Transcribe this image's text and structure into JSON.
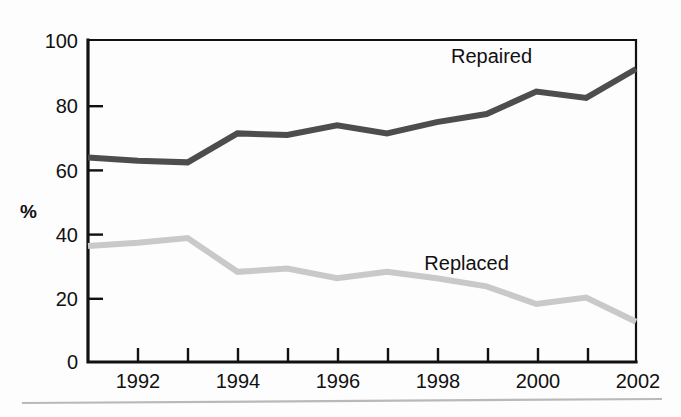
{
  "chart_data": {
    "type": "line",
    "title": "",
    "subtitle": "",
    "xlabel": "",
    "ylabel": "%",
    "x": [
      1991,
      1992,
      1993,
      1994,
      1995,
      1996,
      1997,
      1998,
      1999,
      2000,
      2001,
      2002
    ],
    "xtick_labels": [
      "1992",
      "1994",
      "1996",
      "1998",
      "2000",
      "2002"
    ],
    "xtick_values": [
      1992,
      1994,
      1996,
      1998,
      2000,
      2002
    ],
    "xlim": [
      1991,
      2002
    ],
    "ytick_labels": [
      "0",
      "20",
      "40",
      "60",
      "80",
      "100"
    ],
    "ytick_values": [
      0,
      20,
      40,
      60,
      80,
      100
    ],
    "ylim": [
      0,
      100
    ],
    "grid": false,
    "legend_position": "inline-annotation",
    "series": [
      {
        "name": "Repaired",
        "color": "#4d4d4d",
        "values": [
          63.5,
          62.5,
          62,
          71,
          70.5,
          73.5,
          71,
          74.5,
          77,
          84,
          82,
          91
        ]
      },
      {
        "name": "Replaced",
        "color": "#c9c9c9",
        "values": [
          36,
          37,
          38.5,
          28,
          29,
          26,
          28,
          26,
          23.5,
          18,
          20,
          12.5
        ]
      }
    ],
    "annotations": [
      {
        "text": "Repaired",
        "x": 1999.1,
        "y": 93
      },
      {
        "text": "Replaced",
        "x": 1998.6,
        "y": 28.5
      }
    ]
  },
  "axes": {
    "y_axis_title": "%"
  },
  "colors": {
    "repaired": "#4d4d4d",
    "replaced": "#c9c9c9",
    "axis": "#111111",
    "footer_rule": "#b9b9b9",
    "background": "#fdfdfd"
  }
}
